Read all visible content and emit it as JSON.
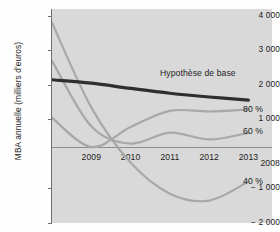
{
  "chart_data": {
    "type": "line",
    "title": "",
    "xlabel": "",
    "ylabel": "MBA annuelle (milliers d'euros)",
    "x": [
      2008,
      2009,
      2010,
      2011,
      2012,
      2013
    ],
    "xlim": [
      2008,
      2013.6
    ],
    "ylim": [
      -2000,
      4200
    ],
    "yticks": [
      4000,
      3000,
      2000,
      1000,
      -1000,
      -2000
    ],
    "ytick_labels": [
      "4 000",
      "3 000",
      "2 000",
      "1 000",
      "− 1 000",
      "− 2 000"
    ],
    "xtick_labels": [
      "2008",
      "2009",
      "2010",
      "2011",
      "2012",
      "2013"
    ],
    "zero_line": 0,
    "grid": false,
    "legend_position": "inline-right",
    "series": [
      {
        "name": "Hypothèse de base",
        "label": "Hypothèse de base",
        "color": "#2f2f2f",
        "width": 3.2,
        "points": [
          {
            "x": 2008,
            "y": 2150
          },
          {
            "x": 2009,
            "y": 2050
          },
          {
            "x": 2010,
            "y": 1900
          },
          {
            "x": 2011,
            "y": 1760
          },
          {
            "x": 2012,
            "y": 1650
          },
          {
            "x": 2013,
            "y": 1560
          }
        ]
      },
      {
        "name": "80 %",
        "label": "80 %",
        "color": "#a8a8a8",
        "width": 2.2,
        "points": [
          {
            "x": 2008,
            "y": 1050
          },
          {
            "x": 2009,
            "y": 200
          },
          {
            "x": 2010,
            "y": 780
          },
          {
            "x": 2011,
            "y": 1250
          },
          {
            "x": 2012,
            "y": 1230
          },
          {
            "x": 2013,
            "y": 1290
          }
        ]
      },
      {
        "name": "60 %",
        "label": "60 %",
        "color": "#a8a8a8",
        "width": 2.2,
        "points": [
          {
            "x": 2008,
            "y": 2700
          },
          {
            "x": 2009,
            "y": 800
          },
          {
            "x": 2010,
            "y": 300
          },
          {
            "x": 2011,
            "y": 620
          },
          {
            "x": 2012,
            "y": 420
          },
          {
            "x": 2013,
            "y": 610
          }
        ]
      },
      {
        "name": "40 %",
        "label": "40 %",
        "color": "#a8a8a8",
        "width": 2.2,
        "points": [
          {
            "x": 2008,
            "y": 3800
          },
          {
            "x": 2009,
            "y": 1350
          },
          {
            "x": 2010,
            "y": -250
          },
          {
            "x": 2011,
            "y": -1150
          },
          {
            "x": 2012,
            "y": -1350
          },
          {
            "x": 2013,
            "y": -800
          }
        ]
      }
    ]
  },
  "axis": {
    "y_title": "MBA annuelle (milliers d'euros)",
    "y_labels": [
      "4 000",
      "3 000",
      "2 000",
      "1 000",
      "2008",
      "− 1 000",
      "− 2 000"
    ],
    "x_labels": [
      "2009",
      "2010",
      "2011",
      "2012",
      "2013"
    ]
  },
  "annotations": {
    "baseline": "Hypothèse de base",
    "s80": "80 %",
    "s60": "60 %",
    "s40": "40 %"
  },
  "colors": {
    "panel_background": "#d9d9d9",
    "baseline_line": "#2f2f2f",
    "scenario_line": "#a8a8a8",
    "axis": "#6f6f6f",
    "text": "#1d1d1d"
  }
}
